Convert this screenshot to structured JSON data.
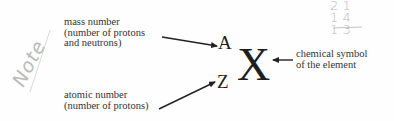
{
  "diagram": {
    "symbols": {
      "mass": "A",
      "atomic": "Z",
      "element": "X"
    },
    "labels": {
      "mass_number": [
        "mass number",
        "(number of protons",
        "and neutrons)"
      ],
      "atomic_number": [
        "atomic number",
        "(number of protons)"
      ],
      "chemical_symbol": [
        "chemical symbol",
        "of the element"
      ]
    },
    "annotations": {
      "handwritten_note": "Note",
      "handwritten_calc": [
        "2 1",
        "1 4",
        "1 3"
      ]
    },
    "colors": {
      "text": "#333333",
      "symbols": "#1e1e1e",
      "arrows": "#222222",
      "handwriting": "#b9b9b9",
      "background": "#fefefe"
    }
  }
}
